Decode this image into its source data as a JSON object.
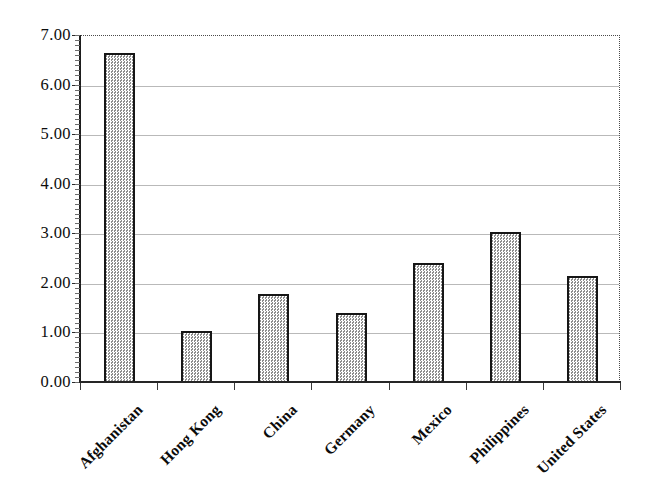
{
  "chart_data": {
    "type": "bar",
    "title": "",
    "subtitle": "",
    "xlabel": "",
    "ylabel": "",
    "categories": [
      "Afghanistan",
      "Hong Kong",
      "China",
      "Germany",
      "Mexico",
      "Philippines",
      "United States"
    ],
    "values": [
      6.66,
      1.04,
      1.8,
      1.42,
      2.43,
      3.05,
      2.16
    ],
    "ylim": [
      0.0,
      7.0
    ],
    "ytick_step": 1.0,
    "ytick_labels": [
      "0.00",
      "1.00",
      "2.00",
      "3.00",
      "4.00",
      "5.00",
      "6.00",
      "7.00"
    ],
    "ytick_values": [
      0,
      1,
      2,
      3,
      4,
      5,
      6,
      7
    ],
    "grid": true,
    "grid_axis": "y",
    "legend": false,
    "legend_position": "none",
    "bar_fill_color": "#c9c9c9",
    "bar_edge_color": "#161616",
    "grid_color": "#b9b9b9",
    "axis_color": "#1d1d1d",
    "background_color": "#ffffff",
    "label_rotation_degrees": -45
  }
}
